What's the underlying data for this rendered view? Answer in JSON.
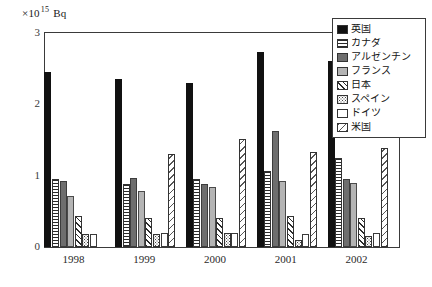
{
  "chart_data": {
    "type": "bar",
    "title": "",
    "subtitle": "",
    "xlabel": "",
    "ylabel": "×10¹⁵ Bq",
    "unit_caption": {
      "multiplier": "×10",
      "exponent": "15",
      "unit": "Bq"
    },
    "categories": [
      "1998",
      "1999",
      "2000",
      "2001",
      "2002"
    ],
    "ylim": [
      0,
      3
    ],
    "yticks": [
      "0",
      "1",
      "2",
      "3"
    ],
    "ytick_values": [
      0,
      1,
      2,
      3
    ],
    "grid": false,
    "legend_position": "top-right",
    "series": [
      {
        "name": "英国",
        "pattern": "solid-black",
        "color": "#111111",
        "values": [
          2.45,
          2.36,
          2.3,
          2.73,
          2.61
        ]
      },
      {
        "name": "カナダ",
        "pattern": "horizontal-lines",
        "color": "#2b2b2b",
        "values": [
          0.95,
          0.88,
          0.95,
          1.06,
          1.25
        ]
      },
      {
        "name": "アルゼンチン",
        "pattern": "dark-gray",
        "color": "#6e6e6e",
        "values": [
          0.93,
          0.97,
          0.89,
          1.62,
          0.96
        ]
      },
      {
        "name": "フランス",
        "pattern": "mid-gray",
        "color": "#b4b4b4",
        "values": [
          0.72,
          0.78,
          0.84,
          0.93,
          0.9
        ]
      },
      {
        "name": "日本",
        "pattern": "diagonal-hatch",
        "color": "#2b2b2b",
        "values": [
          0.43,
          0.4,
          0.4,
          0.43,
          0.41
        ]
      },
      {
        "name": "スペイン",
        "pattern": "dots",
        "color": "#444444",
        "values": [
          0.18,
          0.18,
          0.19,
          0.1,
          0.16
        ]
      },
      {
        "name": "ドイツ",
        "pattern": "white",
        "color": "#ffffff",
        "values": [
          0.18,
          0.2,
          0.19,
          0.18,
          0.2
        ]
      },
      {
        "name": "米国",
        "pattern": "back-hatch",
        "color": "#565656",
        "values": [
          0.0,
          1.3,
          1.52,
          1.33,
          1.39
        ]
      }
    ]
  },
  "legend": {
    "items": [
      {
        "label": "英国",
        "swatch": "solid-black"
      },
      {
        "label": "カナダ",
        "swatch": "horizontal-lines"
      },
      {
        "label": "アルゼンチン",
        "swatch": "dark-gray"
      },
      {
        "label": "フランス",
        "swatch": "mid-gray"
      },
      {
        "label": "日本",
        "swatch": "diagonal-hatch"
      },
      {
        "label": "スペイン",
        "swatch": "dots"
      },
      {
        "label": "ドイツ",
        "swatch": "white"
      },
      {
        "label": "米国",
        "swatch": "back-hatch"
      }
    ]
  }
}
